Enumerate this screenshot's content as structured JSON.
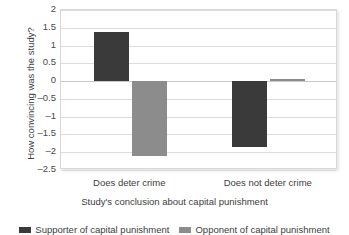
{
  "chart_data": {
    "type": "bar",
    "title": "",
    "xlabel": "Study's conclusion about capital punishment",
    "ylabel": "How convincing was the study?",
    "categories": [
      "Does deter crime",
      "Does not deter crime"
    ],
    "series": [
      {
        "name": "Supporter of capital punishment",
        "color": "#3a3a3a",
        "values": [
          1.39,
          -1.86
        ]
      },
      {
        "name": "Opponent of capital punishment",
        "color": "#8c8c8c",
        "values": [
          -2.11,
          0.07
        ]
      }
    ],
    "ylim": [
      -2.5,
      2
    ],
    "ytick_labels": [
      "2",
      "1.5",
      "1",
      "0.5",
      "0",
      "-0.5",
      "-1",
      "-1.5",
      "-2",
      "-2.5"
    ],
    "ytick_values": [
      2,
      1.5,
      1,
      0.5,
      0,
      -0.5,
      -1,
      -1.5,
      -2,
      -2.5
    ],
    "grid": true,
    "legend_position": "bottom"
  },
  "axis": {
    "y_title": "How convincing was the study?",
    "x_title": "Study's conclusion about capital punishment"
  },
  "legend": {
    "items": [
      {
        "label": "Supporter of capital punishment"
      },
      {
        "label": "Opponent of capital punishment"
      }
    ]
  }
}
